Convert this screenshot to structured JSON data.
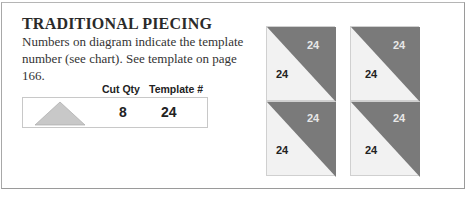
{
  "heading": "TRADITIONAL PIECING",
  "description": "Numbers on diagram indicate the template number (see chart). See template on page 166.",
  "chart": {
    "headers": {
      "cut_qty": "Cut Qty",
      "template": "Template #"
    },
    "rows": [
      {
        "shape": "half-square triangle",
        "cut_qty": "8",
        "template": "24"
      }
    ]
  },
  "diagram": {
    "blocks": [
      {
        "dark": "24",
        "light": "24"
      },
      {
        "dark": "24",
        "light": "24"
      },
      {
        "dark": "24",
        "light": "24"
      },
      {
        "dark": "24",
        "light": "24"
      }
    ]
  },
  "colors": {
    "dark_fabric": "#7a7a7a",
    "light_fabric": "#f2f2f2",
    "template_fill": "#c8c8c8"
  }
}
